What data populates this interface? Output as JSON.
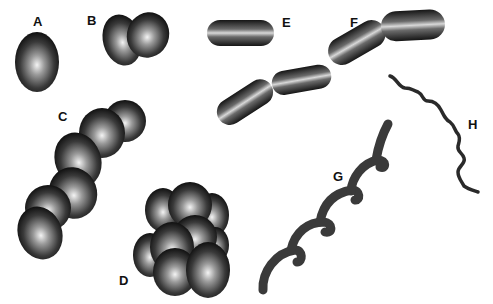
{
  "figure": {
    "labels": {
      "A": "A",
      "B": "B",
      "C": "C",
      "D": "D",
      "E": "E",
      "F": "F",
      "G": "G",
      "H": "H"
    },
    "panels": [
      {
        "id": "A",
        "shape": "single coccus"
      },
      {
        "id": "B",
        "shape": "diplococcus"
      },
      {
        "id": "C",
        "shape": "chain of cocci"
      },
      {
        "id": "D",
        "shape": "cluster of cocci"
      },
      {
        "id": "E",
        "shape": "single rod"
      },
      {
        "id": "F",
        "shape": "chain of rods"
      },
      {
        "id": "G",
        "shape": "spirillum"
      },
      {
        "id": "H",
        "shape": "spirochete"
      }
    ],
    "colors": {
      "background": "#ffffff",
      "cell_dark": "#1a1a1a",
      "cell_highlight": "#f0f0f0",
      "label": "#111111"
    }
  }
}
